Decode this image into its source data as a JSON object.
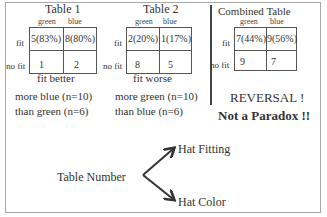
{
  "tables": [
    {
      "title": "Table 1",
      "col_headers": [
        "green",
        "blue"
      ],
      "row_labels": [
        "fit",
        "no fit"
      ],
      "cells": [
        [
          "5(83%)",
          "8(80%)"
        ],
        [
          "1",
          "2"
        ]
      ],
      "caption": "fit better",
      "note_lines": [
        "more blue (n=10)",
        "than green (n=6)"
      ]
    },
    {
      "title": "Table 2",
      "col_headers": [
        "green",
        "blue"
      ],
      "row_labels": [
        "fit",
        "no fit"
      ],
      "cells": [
        [
          "2(20%)",
          "1(17%)"
        ],
        [
          "8",
          "5"
        ]
      ],
      "caption": "fit worse",
      "note_lines": [
        "more green (n=10)",
        "than blue (n=6)"
      ]
    },
    {
      "title": "Combined Table",
      "col_headers": [
        "green",
        "blue"
      ],
      "row_labels": [
        "fit",
        "no fit"
      ],
      "cells": [
        [
          "7(44%)",
          "9(56%)"
        ],
        [
          "9",
          "7"
        ]
      ]
    }
  ],
  "reversal": {
    "line1": "REVERSAL !",
    "line2": "Not a Paradox !!"
  },
  "diagram": {
    "source": "Table Number",
    "targets": [
      "Hat Fitting",
      "Hat Color"
    ]
  }
}
